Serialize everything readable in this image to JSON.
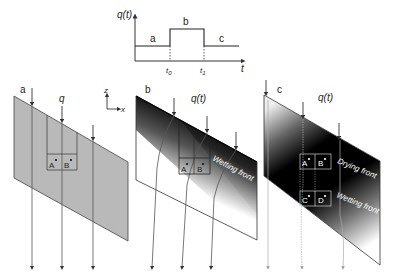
{
  "inset_graph": {
    "y_label": "q(t)",
    "x_label": "t",
    "ticks": [
      "t0",
      "t1"
    ],
    "tick_main": [
      "t",
      "t"
    ],
    "tick_sub": [
      "0",
      "1"
    ],
    "phases": [
      "a",
      "b",
      "c"
    ]
  },
  "axes_indicator": {
    "z": "z",
    "x": "x"
  },
  "panels": [
    {
      "id": "a",
      "label": "a",
      "flux_label": "q",
      "points": [
        "A",
        "B"
      ],
      "fronts": []
    },
    {
      "id": "b",
      "label": "b",
      "flux_label": "q(t)",
      "points": [
        "A",
        "B"
      ],
      "fronts": [
        "Wetting front"
      ]
    },
    {
      "id": "c",
      "label": "c",
      "flux_label": "q(t)",
      "points": [
        "A",
        "B",
        "C",
        "D"
      ],
      "fronts": [
        "Drying front",
        "Wetting front"
      ]
    }
  ],
  "colors": {
    "panel_a_fill": "#b9b9b9",
    "outline": "#333333",
    "flow_line": "#555555",
    "dark": "#000000"
  }
}
